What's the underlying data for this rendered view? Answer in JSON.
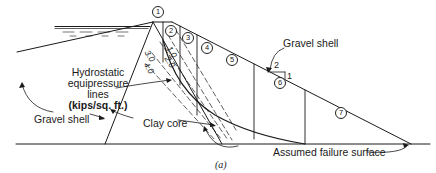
{
  "figure": {
    "caption": "(a)",
    "labels": {
      "gravel_shell_right": "Gravel shell",
      "gravel_shell_left": "Gravel shell",
      "hydrostatic_line1": "Hydrostatic",
      "hydrostatic_line2": "equipressure",
      "hydrostatic_line3": "lines",
      "hydrostatic_line4": "(kips/sq. ft.)",
      "clay_core": "Clay core",
      "failure_surface": "Assumed failure surface"
    },
    "slope_ratio": {
      "horizontal": "2",
      "vertical": "1"
    },
    "isobars": [
      "1.0",
      "2.0",
      "3.0",
      "4.0"
    ],
    "slices": [
      "1",
      "2",
      "3",
      "4",
      "5",
      "6",
      "7"
    ]
  }
}
